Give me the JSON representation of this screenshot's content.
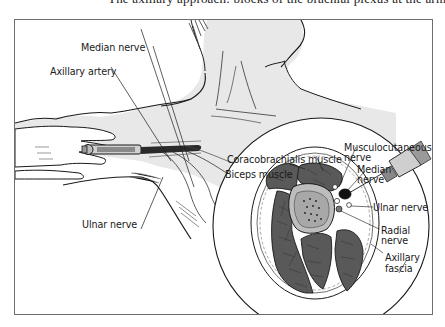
{
  "figure": {
    "title_fragment": "axillary plexus block illustration (top caption cut off)",
    "colors": {
      "frame": "#6e6e6e",
      "skin_shade": "#e6e6e6",
      "muscle": "#5a5a5a",
      "bone": "#bdbdbd",
      "line": "#1a1a1a"
    },
    "labels": {
      "median_nerve_top": "Median nerve",
      "axillary_artery": "Axillary artery",
      "ulnar_nerve_left": "Ulnar nerve",
      "coracobrachialis": "Coracobrachialis muscle",
      "biceps": "Biceps muscle",
      "musculocutaneous_1": "Musculocutaneous",
      "musculocutaneous_2": "nerve",
      "median_inset_1": "Median",
      "median_inset_2": "nerve",
      "ulnar_inset": "Ulnar nerve",
      "radial_1": "Radial",
      "radial_2": "nerve",
      "axillary_fascia_1": "Axillary",
      "axillary_fascia_2": "fascia"
    },
    "icons": {
      "syringe_left": "syringe-icon",
      "syringe_inset": "syringe-icon",
      "cross_section": "arm-cross-section"
    }
  }
}
